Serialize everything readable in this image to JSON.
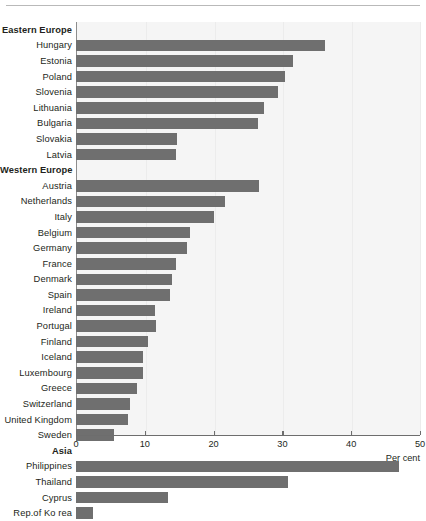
{
  "chart_data": {
    "type": "bar",
    "orientation": "horizontal",
    "title": "",
    "subtitle": "",
    "xlabel": "Per cent",
    "ylabel": "",
    "xlim": [
      0,
      50
    ],
    "xticks": [
      0,
      10,
      20,
      30,
      40,
      50
    ],
    "xtick_labels": [
      "0",
      "10",
      "20",
      "30",
      "40",
      "50"
    ],
    "grid": true,
    "legend": null,
    "bar_color": "#6f6f6f",
    "plot_background": "#f5f5f5",
    "groups": [
      {
        "name": "Eastern Europe",
        "categories": [
          "Hungary",
          "Estonia",
          "Poland",
          "Slovenia",
          "Lithuania",
          "Bulgaria",
          "Slovakia",
          "Latvia"
        ],
        "values": [
          36.2,
          31.5,
          30.4,
          29.3,
          27.3,
          26.4,
          14.7,
          14.6
        ]
      },
      {
        "name": "Western Europe",
        "categories": [
          "Austria",
          "Netherlands",
          "Italy",
          "Belgium",
          "Germany",
          "France",
          "Denmark",
          "Spain",
          "Ireland",
          "Portugal",
          "Finland",
          "Iceland",
          "Luxembourg",
          "Greece",
          "Switzerland",
          "United Kingdom",
          "Sweden"
        ],
        "values": [
          26.6,
          21.6,
          20.0,
          16.6,
          16.1,
          14.6,
          14.0,
          13.6,
          11.5,
          11.7,
          10.5,
          9.8,
          9.7,
          8.9,
          7.9,
          7.6,
          5.5
        ]
      },
      {
        "name": "Asia",
        "categories": [
          "Philippines",
          "Thailand",
          "Cyprus",
          "Rep.of Ko rea"
        ],
        "values": [
          46.9,
          30.8,
          13.3,
          2.5
        ]
      }
    ]
  }
}
